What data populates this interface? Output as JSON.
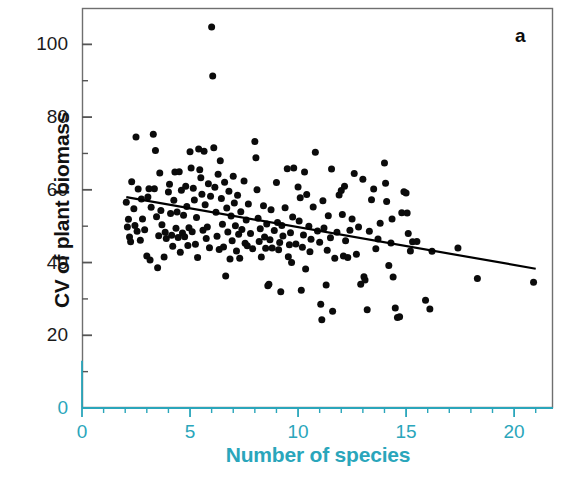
{
  "panel": {
    "letter": "a"
  },
  "axes": {
    "x_title": "Number of species",
    "y_title": "CV of plant biomass",
    "x_tick_labels": [
      "0",
      "5",
      "10",
      "15",
      "20"
    ],
    "y_tick_labels": [
      "0",
      "20",
      "40",
      "60",
      "80",
      "100"
    ]
  },
  "colors": {
    "axis_teal": "#2aa6bb",
    "point_black": "#0b0b0b",
    "frame_gray": "#6f6f6f",
    "background": "#ffffff"
  },
  "chart_data": {
    "type": "scatter",
    "title": "",
    "panel_label": "a",
    "xlabel": "Number of species",
    "ylabel": "CV of plant biomass",
    "xlim": [
      0,
      21.8
    ],
    "ylim": [
      0,
      110
    ],
    "xticks": [
      0,
      5,
      10,
      15,
      20
    ],
    "yticks": [
      0,
      20,
      40,
      60,
      80,
      100
    ],
    "x_minor_tick_step": 1,
    "y_minor_tick_step": 10,
    "grid": false,
    "legend": "none",
    "marker": "filled-circle",
    "marker_color": "#0b0b0b",
    "marker_size_px": 7,
    "trendline": {
      "type": "linear-regression",
      "color": "#000000",
      "width_px": 2.2,
      "x_start": 2.05,
      "y_start": 58.0,
      "x_end": 21.0,
      "y_end": 38.3,
      "slope": -1.04,
      "intercept": 60.1
    },
    "n_points": 213,
    "points": [
      [
        2.05,
        56.6
      ],
      [
        2.1,
        49.8
      ],
      [
        2.15,
        51.9
      ],
      [
        2.2,
        47.0
      ],
      [
        2.25,
        45.7
      ],
      [
        2.3,
        62.2
      ],
      [
        2.4,
        54.8
      ],
      [
        2.45,
        50.2
      ],
      [
        2.5,
        74.5
      ],
      [
        2.55,
        48.6
      ],
      [
        2.6,
        60.2
      ],
      [
        2.7,
        46.1
      ],
      [
        2.75,
        57.5
      ],
      [
        2.8,
        52.0
      ],
      [
        2.9,
        49.0
      ],
      [
        3.0,
        41.8
      ],
      [
        3.05,
        58.0
      ],
      [
        3.1,
        60.3
      ],
      [
        3.15,
        40.7
      ],
      [
        3.2,
        55.2
      ],
      [
        3.3,
        75.3
      ],
      [
        3.35,
        60.3
      ],
      [
        3.4,
        70.8
      ],
      [
        3.45,
        52.6
      ],
      [
        3.5,
        38.6
      ],
      [
        3.55,
        47.4
      ],
      [
        3.6,
        64.6
      ],
      [
        3.65,
        54.3
      ],
      [
        3.7,
        50.4
      ],
      [
        3.8,
        41.5
      ],
      [
        3.85,
        48.3
      ],
      [
        3.9,
        46.6
      ],
      [
        4.0,
        59.4
      ],
      [
        4.05,
        61.5
      ],
      [
        4.1,
        53.5
      ],
      [
        4.15,
        47.5
      ],
      [
        4.2,
        44.5
      ],
      [
        4.25,
        57.1
      ],
      [
        4.3,
        64.9
      ],
      [
        4.35,
        49.4
      ],
      [
        4.4,
        53.9
      ],
      [
        4.45,
        46.9
      ],
      [
        4.5,
        65.0
      ],
      [
        4.55,
        42.8
      ],
      [
        4.6,
        59.9
      ],
      [
        4.65,
        48.1
      ],
      [
        4.7,
        53.0
      ],
      [
        4.75,
        47.1
      ],
      [
        4.8,
        61.0
      ],
      [
        4.85,
        55.4
      ],
      [
        4.9,
        44.7
      ],
      [
        4.95,
        49.6
      ],
      [
        5.0,
        70.5
      ],
      [
        5.05,
        66.0
      ],
      [
        5.1,
        48.5
      ],
      [
        5.15,
        60.4
      ],
      [
        5.2,
        57.2
      ],
      [
        5.25,
        45.0
      ],
      [
        5.3,
        52.4
      ],
      [
        5.35,
        41.4
      ],
      [
        5.4,
        71.2
      ],
      [
        5.45,
        65.5
      ],
      [
        5.5,
        63.3
      ],
      [
        5.55,
        58.8
      ],
      [
        5.6,
        48.9
      ],
      [
        5.65,
        70.6
      ],
      [
        5.7,
        55.9
      ],
      [
        5.75,
        46.6
      ],
      [
        5.8,
        49.8
      ],
      [
        5.85,
        61.7
      ],
      [
        5.9,
        44.1
      ],
      [
        5.95,
        58.2
      ],
      [
        6.0,
        104.8
      ],
      [
        6.05,
        91.3
      ],
      [
        6.1,
        71.6
      ],
      [
        6.15,
        60.7
      ],
      [
        6.2,
        53.8
      ],
      [
        6.25,
        47.2
      ],
      [
        6.3,
        64.3
      ],
      [
        6.35,
        43.6
      ],
      [
        6.4,
        68.0
      ],
      [
        6.45,
        57.6
      ],
      [
        6.5,
        50.5
      ],
      [
        6.55,
        44.3
      ],
      [
        6.6,
        62.1
      ],
      [
        6.65,
        36.3
      ],
      [
        6.7,
        55.0
      ],
      [
        6.75,
        48.4
      ],
      [
        6.8,
        59.6
      ],
      [
        6.85,
        41.0
      ],
      [
        6.9,
        52.8
      ],
      [
        6.95,
        46.0
      ],
      [
        7.0,
        63.7
      ],
      [
        7.05,
        56.4
      ],
      [
        7.1,
        50.1
      ],
      [
        7.15,
        43.2
      ],
      [
        7.2,
        58.5
      ],
      [
        7.25,
        47.8
      ],
      [
        7.3,
        41.2
      ],
      [
        7.35,
        54.0
      ],
      [
        7.4,
        49.1
      ],
      [
        7.5,
        62.4
      ],
      [
        7.55,
        45.3
      ],
      [
        7.6,
        51.7
      ],
      [
        7.65,
        44.6
      ],
      [
        7.7,
        56.1
      ],
      [
        7.8,
        48.0
      ],
      [
        7.9,
        43.8
      ],
      [
        8.0,
        73.3
      ],
      [
        8.05,
        68.8
      ],
      [
        8.1,
        60.0
      ],
      [
        8.15,
        52.2
      ],
      [
        8.2,
        45.8
      ],
      [
        8.25,
        49.3
      ],
      [
        8.3,
        41.5
      ],
      [
        8.4,
        55.6
      ],
      [
        8.45,
        47.0
      ],
      [
        8.5,
        43.9
      ],
      [
        8.55,
        50.6
      ],
      [
        8.6,
        33.6
      ],
      [
        8.65,
        34.0
      ],
      [
        8.7,
        46.3
      ],
      [
        8.75,
        54.5
      ],
      [
        8.8,
        44.0
      ],
      [
        8.9,
        48.8
      ],
      [
        9.0,
        62.0
      ],
      [
        9.05,
        51.0
      ],
      [
        9.1,
        43.5
      ],
      [
        9.15,
        45.5
      ],
      [
        9.2,
        32.0
      ],
      [
        9.25,
        50.2
      ],
      [
        9.3,
        47.3
      ],
      [
        9.4,
        55.1
      ],
      [
        9.5,
        65.8
      ],
      [
        9.55,
        41.6
      ],
      [
        9.6,
        44.9
      ],
      [
        9.65,
        48.2
      ],
      [
        9.7,
        40.0
      ],
      [
        9.75,
        52.5
      ],
      [
        9.8,
        66.0
      ],
      [
        9.9,
        45.1
      ],
      [
        10.0,
        60.8
      ],
      [
        10.05,
        51.4
      ],
      [
        10.1,
        57.8
      ],
      [
        10.15,
        32.4
      ],
      [
        10.2,
        44.2
      ],
      [
        10.25,
        47.6
      ],
      [
        10.3,
        64.9
      ],
      [
        10.35,
        38.2
      ],
      [
        10.4,
        58.7
      ],
      [
        10.5,
        50.0
      ],
      [
        10.55,
        43.0
      ],
      [
        10.6,
        46.4
      ],
      [
        10.7,
        55.3
      ],
      [
        10.8,
        70.3
      ],
      [
        10.9,
        48.7
      ],
      [
        11.0,
        45.6
      ],
      [
        11.05,
        28.5
      ],
      [
        11.1,
        24.3
      ],
      [
        11.15,
        57.0
      ],
      [
        11.2,
        49.5
      ],
      [
        11.3,
        33.8
      ],
      [
        11.35,
        43.4
      ],
      [
        11.4,
        52.9
      ],
      [
        11.5,
        46.8
      ],
      [
        11.55,
        65.7
      ],
      [
        11.6,
        26.6
      ],
      [
        11.7,
        41.2
      ],
      [
        11.8,
        48.3
      ],
      [
        11.9,
        58.6
      ],
      [
        12.0,
        59.8
      ],
      [
        12.05,
        53.2
      ],
      [
        12.1,
        41.8
      ],
      [
        12.15,
        61.0
      ],
      [
        12.2,
        46.0
      ],
      [
        12.3,
        41.4
      ],
      [
        12.4,
        48.9
      ],
      [
        12.5,
        52.0
      ],
      [
        12.6,
        64.5
      ],
      [
        12.7,
        42.3
      ],
      [
        12.8,
        49.8
      ],
      [
        12.9,
        34.0
      ],
      [
        13.0,
        62.9
      ],
      [
        13.05,
        36.1
      ],
      [
        13.1,
        35.2
      ],
      [
        13.2,
        27.0
      ],
      [
        13.3,
        48.6
      ],
      [
        13.4,
        57.3
      ],
      [
        13.5,
        60.2
      ],
      [
        13.6,
        43.8
      ],
      [
        13.7,
        46.5
      ],
      [
        13.8,
        50.8
      ],
      [
        14.0,
        67.4
      ],
      [
        14.05,
        61.8
      ],
      [
        14.1,
        56.8
      ],
      [
        14.2,
        39.2
      ],
      [
        14.3,
        45.4
      ],
      [
        14.35,
        52.0
      ],
      [
        14.4,
        36.0
      ],
      [
        14.5,
        27.5
      ],
      [
        14.6,
        24.9
      ],
      [
        14.7,
        25.1
      ],
      [
        14.8,
        53.7
      ],
      [
        14.9,
        59.5
      ],
      [
        15.0,
        59.1
      ],
      [
        15.05,
        53.6
      ],
      [
        15.1,
        48.0
      ],
      [
        15.2,
        43.2
      ],
      [
        15.3,
        45.7
      ],
      [
        15.5,
        45.8
      ],
      [
        15.9,
        29.6
      ],
      [
        16.1,
        27.2
      ],
      [
        16.2,
        43.1
      ],
      [
        17.4,
        44.0
      ],
      [
        18.3,
        35.6
      ],
      [
        20.9,
        34.6
      ]
    ]
  }
}
